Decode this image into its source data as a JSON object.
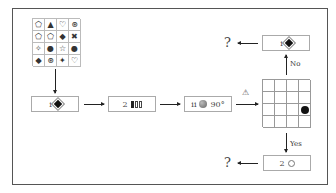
{
  "symbol_grid": {
    "rows": 4,
    "cols": 4,
    "cells": [
      "⬠",
      "▲",
      "♡",
      "⊛",
      "⬠",
      "⬠",
      "◆",
      "✖",
      "✧",
      "●",
      "☆",
      "●",
      "◆",
      "⊛",
      "✦",
      "♡"
    ]
  },
  "steps": [
    {
      "id": "step1",
      "index": "i",
      "symbol": "diamond-filled"
    },
    {
      "id": "step2",
      "index": "2",
      "symbol": "bars"
    },
    {
      "id": "step3",
      "index": "ii",
      "symbol": "sphere",
      "rotation": "90°"
    }
  ],
  "warning_label": "⚠",
  "position_grid": {
    "rows": 4,
    "cols": 4,
    "dot_row": 3,
    "dot_col": 4
  },
  "branch_no": {
    "label": "No",
    "box_index": "i",
    "symbol": "diamond-filled",
    "result": "?"
  },
  "branch_yes": {
    "label": "Yes",
    "box_index": "2",
    "symbol": "circle-outline",
    "result": "?"
  }
}
